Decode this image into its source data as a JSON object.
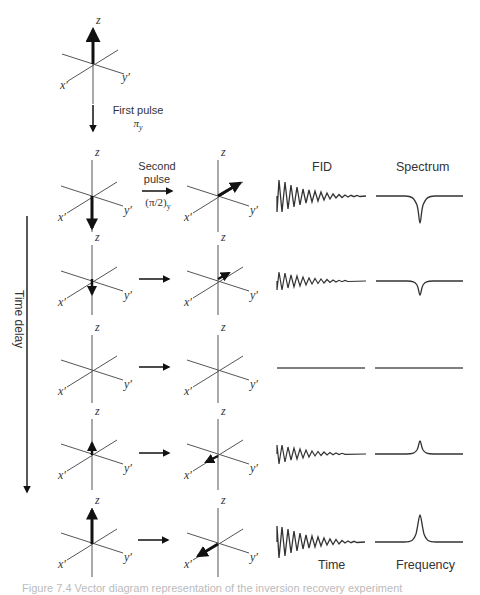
{
  "figure": {
    "top_state": {
      "vector": "+z"
    },
    "first_pulse": {
      "label": "First pulse",
      "sub": "π",
      "subscript": "y"
    },
    "second_pulse": {
      "label_line1": "Second",
      "label_line2": "pulse",
      "angle": "(π/2)",
      "subscript": "y"
    },
    "column_headers": {
      "fid": "FID",
      "spectrum": "Spectrum"
    },
    "axis_labels": {
      "z": "z",
      "x": "x′",
      "y": "y′"
    },
    "time_delay_label": "Time delay",
    "footer_labels": {
      "time": "Time",
      "frequency": "Frequency"
    },
    "caption": "Figure 7.4  Vector diagram representation of the inversion recovery experiment",
    "rows": [
      {
        "before_vector": "-z (full)",
        "after_vector": "-x′ (full)",
        "fid_amplitude": -1.0,
        "spectrum": "negative peak (full)"
      },
      {
        "before_vector": "-z (partial)",
        "after_vector": "-x′ (partial)",
        "fid_amplitude": -0.5,
        "spectrum": "negative peak (small)"
      },
      {
        "before_vector": "none",
        "after_vector": "none",
        "fid_amplitude": 0.0,
        "spectrum": "flat (null)"
      },
      {
        "before_vector": "+z (partial)",
        "after_vector": "+x′ (partial)",
        "fid_amplitude": 0.55,
        "spectrum": "positive peak (small)"
      },
      {
        "before_vector": "+z (full)",
        "after_vector": "+x′ (full)",
        "fid_amplitude": 1.0,
        "spectrum": "positive peak (full)"
      }
    ]
  },
  "colors": {
    "line": "#444444",
    "vector": "#111111",
    "text": "#333333"
  }
}
